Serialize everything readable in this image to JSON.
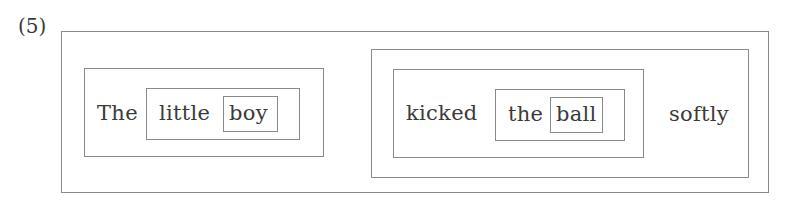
{
  "example_label": "(5)",
  "sentence": {
    "subject_np": {
      "determiner": "The",
      "modifier": "little",
      "head_noun": "boy"
    },
    "predicate": {
      "verb": "kicked",
      "object_np": {
        "determiner": "the",
        "head_noun": "ball"
      },
      "adverb": "softly"
    }
  },
  "colors": {
    "border": "#8a8a8a",
    "text": "#3a3a3a",
    "background": "#ffffff"
  }
}
